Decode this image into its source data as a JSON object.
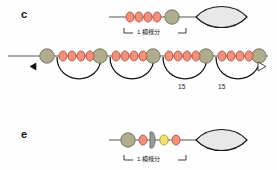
{
  "figure": {
    "type": "schematic-diagram",
    "background_color": "#fefefe",
    "width": 277,
    "height": 170
  },
  "palette": {
    "bead_small_fill": "#f0907a",
    "bead_small_stroke": "#b8503c",
    "bead_large_fill": "#b0ac8e",
    "bead_large_stroke": "#6e6a55",
    "bead_yellow_fill": "#f2e36a",
    "bead_yellow_stroke": "#a89b30",
    "plate_fill": "#9a9a9a",
    "plate_stroke": "#5a5a5a",
    "lens_fill": "#e8e8e8",
    "lens_stroke": "#1a1a1a",
    "line_stroke": "#555555",
    "arc_stroke": "#111111",
    "text_color": "#1a1a1a"
  },
  "panels": [
    {
      "id": "c",
      "letter": "c",
      "description": "linear repeat unit with four small beads, one large bead, and a lens body",
      "scale_label": "1 模様分",
      "elements": {
        "small_beads": 4,
        "large_beads": 1,
        "lens_bodies": 1
      }
    },
    {
      "id": "d",
      "letter": "",
      "description": "periodic fiber: alternating large beads and four-bead clusters with looped arcs below",
      "repeat_count": 4,
      "left_marker": "filled-left-triangle",
      "right_marker": "open-right-triangle",
      "loop_labels": [
        "15",
        "15"
      ],
      "elements": {
        "small_beads_per_cluster": 4,
        "large_beads": 5,
        "arcs": 4
      }
    },
    {
      "id": "e",
      "letter": "e",
      "description": "variant repeat unit: large bead, orange bead, gray plate, yellow bead, orange bead, lens body",
      "scale_label": "1 模様分",
      "elements": {
        "large_beads": 1,
        "orange_beads": 2,
        "yellow_beads": 1,
        "plates": 1,
        "lens_bodies": 1
      }
    }
  ],
  "annotations": {
    "scale_bracket_label_c": "1 模様分",
    "scale_bracket_label_e": "1 模様分",
    "loop_size_label_left": "15",
    "loop_size_label_right": "15"
  }
}
